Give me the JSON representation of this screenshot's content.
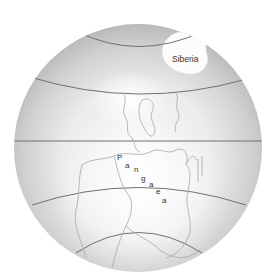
{
  "map": {
    "labels": {
      "siberia": "Siberia",
      "pangaea_letters": [
        "P",
        "a",
        "n",
        "g",
        "a",
        "e",
        "a"
      ]
    },
    "colors": {
      "background": "#ffffff",
      "globe_edge": "#b8b8b8",
      "globe_light": "#f4f4f4",
      "latitude_line": "#707070",
      "coastline": "#b0b0b0",
      "land_highlight": "#fafafa",
      "label_text": "#333333"
    }
  }
}
